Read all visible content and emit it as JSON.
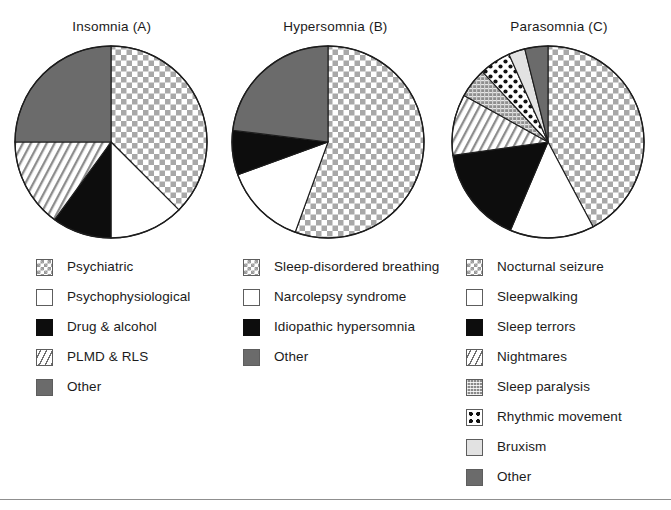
{
  "figure": {
    "background": "#ffffff",
    "rule_color": "#8f8f8f"
  },
  "charts": [
    {
      "id": "insomnia",
      "title": "Insomnia (A)",
      "legend": [
        {
          "label": "Psychiatric",
          "pattern": "checker",
          "swatch_class": "sw-checker"
        },
        {
          "label": "Psychophysiological",
          "pattern": "white",
          "swatch_class": "sw-white"
        },
        {
          "label": "Drug & alcohol",
          "pattern": "black",
          "swatch_class": "sw-black"
        },
        {
          "label": "PLMD & RLS",
          "pattern": "diagonal",
          "swatch_class": "sw-diag"
        },
        {
          "label": "Other",
          "pattern": "gray",
          "swatch_class": "sw-gray"
        }
      ]
    },
    {
      "id": "hypersomnia",
      "title": "Hypersomnia (B)",
      "legend": [
        {
          "label": "Sleep-disordered breathing",
          "pattern": "checker",
          "swatch_class": "sw-checker"
        },
        {
          "label": "Narcolepsy syndrome",
          "pattern": "white",
          "swatch_class": "sw-white"
        },
        {
          "label": "Idiopathic hypersomnia",
          "pattern": "black",
          "swatch_class": "sw-black"
        },
        {
          "label": "Other",
          "pattern": "gray",
          "swatch_class": "sw-gray"
        }
      ]
    },
    {
      "id": "parasomnia",
      "title": "Parasomnia (C)",
      "legend": [
        {
          "label": "Nocturnal seizure",
          "pattern": "checker",
          "swatch_class": "sw-checker"
        },
        {
          "label": "Sleepwalking",
          "pattern": "white",
          "swatch_class": "sw-white"
        },
        {
          "label": "Sleep terrors",
          "pattern": "black",
          "swatch_class": "sw-black"
        },
        {
          "label": "Nightmares",
          "pattern": "diagonal",
          "swatch_class": "sw-diag"
        },
        {
          "label": "Sleep paralysis",
          "pattern": "grayfine",
          "swatch_class": "sw-grayfine"
        },
        {
          "label": "Rhythmic movement",
          "pattern": "dots",
          "swatch_class": "sw-dots"
        },
        {
          "label": "Bruxism",
          "pattern": "lightgray",
          "swatch_class": "sw-lightgray"
        },
        {
          "label": "Other",
          "pattern": "gray",
          "swatch_class": "sw-gray"
        }
      ]
    }
  ],
  "chart_data": [
    {
      "type": "pie",
      "title": "Insomnia (A)",
      "start_angle_deg": 0,
      "direction": "clockwise",
      "categories": [
        "Psychiatric",
        "Psychophysiological",
        "Drug & alcohol",
        "PLMD & RLS",
        "Other"
      ],
      "values": [
        37.5,
        12.5,
        10.0,
        15.0,
        25.0
      ],
      "unit": "percent",
      "patterns": [
        "checker",
        "white",
        "black",
        "diagonal",
        "gray"
      ],
      "angles_deg": [
        135,
        45,
        36,
        54,
        90
      ],
      "legend_position": "below"
    },
    {
      "type": "pie",
      "title": "Hypersomnia (B)",
      "start_angle_deg": 0,
      "direction": "clockwise",
      "categories": [
        "Sleep-disordered breathing",
        "Narcolepsy syndrome",
        "Idiopathic hypersomnia",
        "Other"
      ],
      "values": [
        55.5,
        14.0,
        7.5,
        23.0
      ],
      "unit": "percent",
      "patterns": [
        "checker",
        "white",
        "black",
        "gray"
      ],
      "angles_deg": [
        200,
        50,
        27,
        83
      ],
      "legend_position": "below"
    },
    {
      "type": "pie",
      "title": "Parasomnia (C)",
      "start_angle_deg": 0,
      "direction": "clockwise",
      "categories": [
        "Nocturnal seizure",
        "Sleepwalking",
        "Sleep terrors",
        "Nightmares",
        "Sleep paralysis",
        "Rhythmic movement",
        "Bruxism",
        "Other"
      ],
      "values": [
        42.2,
        14.2,
        16.4,
        10.3,
        5.0,
        5.3,
        2.8,
        3.8
      ],
      "unit": "percent",
      "patterns": [
        "checker",
        "white",
        "black",
        "diagonal",
        "grayfine",
        "dots",
        "lightgray",
        "gray"
      ],
      "angles_deg": [
        152,
        51,
        59,
        37,
        18,
        19,
        10,
        14
      ],
      "legend_position": "below"
    }
  ]
}
